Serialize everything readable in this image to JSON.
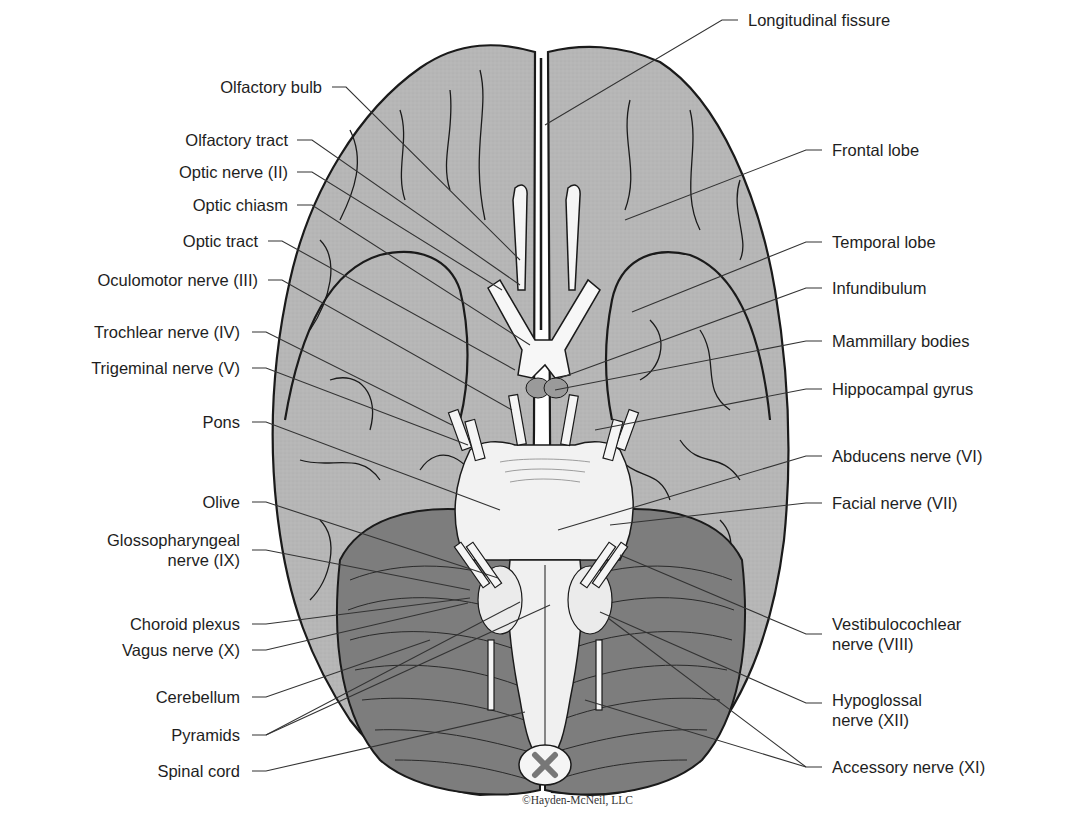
{
  "diagram": {
    "credit": "©Hayden-McNeil, LLC",
    "colors": {
      "cerebrum": "#b4b4b4",
      "cerebellum": "#7d7d7d",
      "brainstem": "#f2f2f2",
      "outline": "#1a1a1a",
      "leader": "#333333"
    },
    "labels_left": [
      {
        "text": "Olfactory bulb"
      },
      {
        "text": "Olfactory tract"
      },
      {
        "text": "Optic nerve (II)"
      },
      {
        "text": "Optic chiasm"
      },
      {
        "text": "Optic tract"
      },
      {
        "text": "Oculomotor nerve (III)"
      },
      {
        "text": "Trochlear nerve (IV)"
      },
      {
        "text": "Trigeminal nerve (V)"
      },
      {
        "text": "Pons"
      },
      {
        "text": "Olive"
      },
      {
        "text": "Glossopharyngeal nerve (IX)",
        "line1": "Glossopharyngeal",
        "line2": "nerve (IX)"
      },
      {
        "text": "Choroid plexus"
      },
      {
        "text": "Vagus nerve (X)"
      },
      {
        "text": "Cerebellum"
      },
      {
        "text": "Pyramids"
      },
      {
        "text": "Spinal cord"
      }
    ],
    "labels_right": [
      {
        "text": "Longitudinal fissure"
      },
      {
        "text": "Frontal lobe"
      },
      {
        "text": "Temporal lobe"
      },
      {
        "text": "Infundibulum"
      },
      {
        "text": "Mammillary bodies"
      },
      {
        "text": "Hippocampal gyrus"
      },
      {
        "text": "Abducens nerve (VI)"
      },
      {
        "text": "Facial nerve (VII)"
      },
      {
        "text": "Vestibulocochlear nerve (VIII)",
        "line1": "Vestibulocochlear",
        "line2": "nerve (VIII)"
      },
      {
        "text": "Hypoglossal nerve (XII)",
        "line1": "Hypoglossal",
        "line2": "nerve (XII)"
      },
      {
        "text": "Accessory nerve (XI)"
      }
    ]
  }
}
